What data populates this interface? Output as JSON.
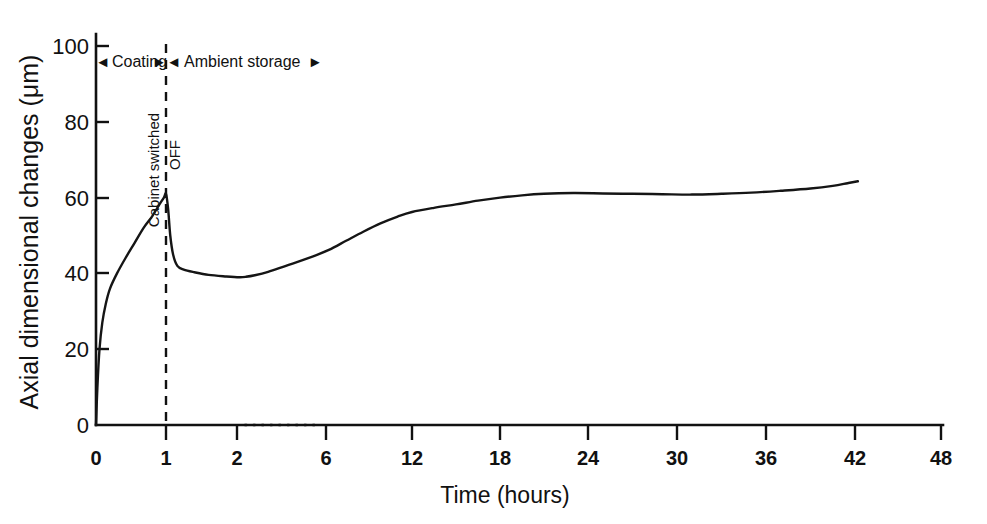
{
  "chart_data": {
    "type": "line",
    "title": "",
    "xlabel": "Time (hours)",
    "ylabel": "Axial dimensional changes (μm)",
    "xlim": [
      0,
      48
    ],
    "ylim": [
      0,
      100
    ],
    "grid": false,
    "legend": "none",
    "x_ticks": [
      "0",
      "1",
      "2",
      "6",
      "12",
      "18",
      "24",
      "30",
      "36",
      "42",
      "48"
    ],
    "x_tick_values": [
      0,
      1,
      2,
      6,
      12,
      18,
      24,
      30,
      36,
      42,
      48
    ],
    "y_ticks": [
      "0",
      "20",
      "40",
      "60",
      "80",
      "100"
    ],
    "y_tick_values": [
      0,
      20,
      40,
      60,
      80,
      100
    ],
    "axis_break": {
      "between": [
        2,
        6
      ],
      "style": "dotted"
    },
    "series": [
      {
        "name": "Axial dimensional change",
        "points": [
          [
            0.0,
            0
          ],
          [
            0.02,
            10
          ],
          [
            0.05,
            20
          ],
          [
            0.09,
            27
          ],
          [
            0.14,
            32
          ],
          [
            0.2,
            36
          ],
          [
            0.3,
            40
          ],
          [
            0.42,
            44
          ],
          [
            0.55,
            48
          ],
          [
            0.68,
            52
          ],
          [
            0.8,
            55
          ],
          [
            0.9,
            58
          ],
          [
            0.97,
            60
          ],
          [
            1.0,
            61
          ],
          [
            1.03,
            57
          ],
          [
            1.06,
            50
          ],
          [
            1.1,
            45
          ],
          [
            1.16,
            42
          ],
          [
            1.25,
            41
          ],
          [
            1.4,
            40.3
          ],
          [
            1.6,
            39.6
          ],
          [
            1.85,
            39.2
          ],
          [
            2.1,
            39.0
          ],
          [
            2.4,
            39.1
          ],
          [
            2.8,
            39.5
          ],
          [
            3.4,
            40.4
          ],
          [
            4.2,
            42.0
          ],
          [
            5.2,
            44.0
          ],
          [
            6.2,
            46.2
          ],
          [
            7.4,
            48.6
          ],
          [
            8.6,
            51.0
          ],
          [
            9.8,
            53.2
          ],
          [
            11.0,
            55.0
          ],
          [
            12.0,
            56.2
          ],
          [
            13.5,
            57.3
          ],
          [
            15.0,
            58.2
          ],
          [
            16.5,
            59.2
          ],
          [
            18.0,
            60.0
          ],
          [
            19.5,
            60.6
          ],
          [
            21.0,
            61.0
          ],
          [
            23.0,
            61.2
          ],
          [
            25.0,
            61.1
          ],
          [
            27.0,
            61.0
          ],
          [
            29.0,
            60.9
          ],
          [
            31.0,
            60.8
          ],
          [
            33.0,
            61.0
          ],
          [
            35.0,
            61.3
          ],
          [
            37.0,
            61.8
          ],
          [
            39.0,
            62.4
          ],
          [
            40.5,
            63.1
          ],
          [
            41.5,
            63.8
          ],
          [
            42.2,
            64.3
          ]
        ]
      }
    ],
    "annotations": [
      {
        "id": "phase-coating",
        "text": "Coating",
        "from_x": 0,
        "to_x": 1,
        "at_y": 96,
        "arrows": "both"
      },
      {
        "id": "phase-ambient",
        "text": "Ambient storage",
        "from_x": 1,
        "to_x": 13.5,
        "at_y": 96,
        "arrows": "both"
      },
      {
        "id": "event-cabinet",
        "text_line_1": "Cabinet switched",
        "text_line_2": "OFF",
        "at_x": 1,
        "style": "dashed vertical line"
      }
    ]
  },
  "figure": {
    "y_axis_title": "Axial dimensional changes (μm)",
    "x_axis_title": "Time (hours)",
    "phase_coating_label": "Coating",
    "phase_ambient_label": "Ambient storage",
    "event_label_line1": "Cabinet switched",
    "event_label_line2": "OFF",
    "arrow_left_glyph": "◂",
    "arrow_right_glyph": "▸",
    "colors": {
      "ink": "#111111",
      "curve": "#151515",
      "background": "#ffffff"
    }
  }
}
